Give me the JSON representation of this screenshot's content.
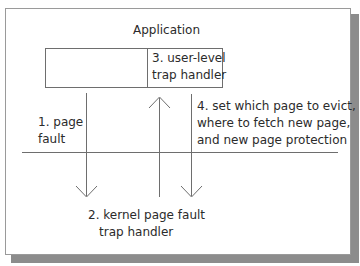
{
  "diagram": {
    "title": "Application",
    "app_box": {
      "left_section": "",
      "right_section_lines": [
        "3. user-level",
        "trap handler"
      ]
    },
    "boundary": "user/kernel boundary line",
    "labels": {
      "step1": [
        "1. page",
        "fault"
      ],
      "step2": [
        "2. kernel page fault",
        "trap handler"
      ],
      "step3": [
        "3. user-level",
        "trap handler"
      ],
      "step4": [
        "4. set which page to evict,",
        "where to fetch new page,",
        "and new page protection"
      ]
    },
    "arrows": [
      {
        "id": "page-fault",
        "direction": "down",
        "from": "application",
        "to": "kernel"
      },
      {
        "id": "upcall",
        "direction": "up",
        "from": "kernel",
        "to": "user-level trap handler"
      },
      {
        "id": "set-policy",
        "direction": "down",
        "from": "user-level trap handler",
        "to": "kernel"
      }
    ],
    "colors": {
      "line": "#6e6e6e",
      "text": "#2b2b2b",
      "shadow": "#8c8c8c",
      "frame_border": "#9a9a9a"
    }
  }
}
